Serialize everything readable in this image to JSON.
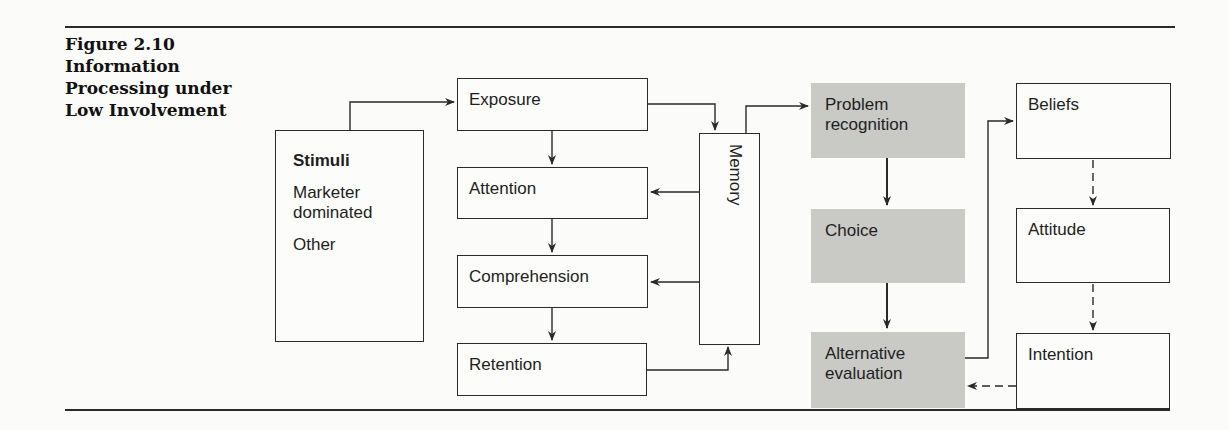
{
  "figure": {
    "number": "Figure 2.10",
    "title_lines": [
      "Information",
      "Processing under",
      "Low Involvement"
    ]
  },
  "stimuli": {
    "title": "Stimuli",
    "items": [
      "Marketer dominated",
      "Other"
    ]
  },
  "processing_stages": [
    "Exposure",
    "Attention",
    "Comprehension",
    "Retention"
  ],
  "memory": "Memory",
  "decision_process": [
    "Problem recognition",
    "Choice",
    "Alternative evaluation"
  ],
  "attitude_formation": [
    "Beliefs",
    "Attitude",
    "Intention"
  ],
  "colors": {
    "decision_box_fill": "#c9c9c6",
    "line": "#2a2a2a",
    "background": "#fbfbf9"
  }
}
